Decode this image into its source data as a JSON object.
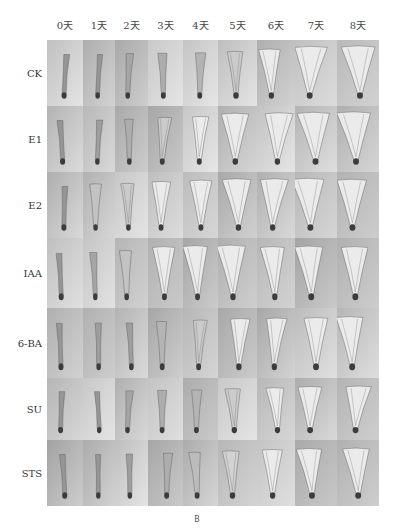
{
  "figure": {
    "caption": "B",
    "columns": [
      "0天",
      "1天",
      "2天",
      "3天",
      "4天",
      "5天",
      "6天",
      "7天",
      "8天"
    ],
    "rows": [
      {
        "label": "CK",
        "opening": [
          0,
          0,
          0.1,
          0.15,
          0.2,
          0.35,
          0.6,
          0.9,
          0.95
        ]
      },
      {
        "label": "E1",
        "opening": [
          0,
          0.05,
          0.15,
          0.35,
          0.45,
          0.8,
          0.85,
          0.9,
          0.95
        ]
      },
      {
        "label": "E2",
        "opening": [
          0,
          0.3,
          0.35,
          0.55,
          0.7,
          0.85,
          0.85,
          0.9,
          0.8
        ]
      },
      {
        "label": "IAA",
        "opening": [
          0,
          0.1,
          0.3,
          0.7,
          0.8,
          0.85,
          0.7,
          0.75,
          0.7
        ]
      },
      {
        "label": "6-BA",
        "opening": [
          0,
          0.05,
          0.05,
          0.2,
          0.35,
          0.5,
          0.55,
          0.6,
          0.7
        ]
      },
      {
        "label": "SU",
        "opening": [
          0,
          0,
          0.1,
          0.15,
          0.2,
          0.35,
          0.45,
          0.6,
          0.65
        ]
      },
      {
        "label": "STS",
        "opening": [
          0,
          0,
          0.05,
          0.15,
          0.25,
          0.4,
          0.55,
          0.65,
          0.7
        ]
      }
    ]
  }
}
